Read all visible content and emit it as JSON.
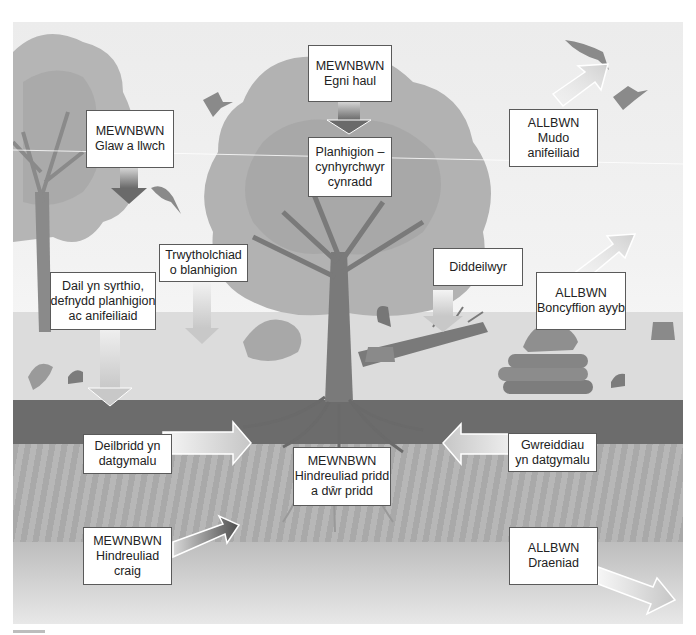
{
  "diagram": {
    "colors": {
      "sky": "#efefef",
      "ground": "#dcdcdc",
      "topsoil": "#6c6c6c",
      "subsoil": "#b0b0b0",
      "box_border": "#5a5a5a",
      "box_fill": "#ffffff"
    },
    "labels": {
      "glaw": {
        "line1": "MEWNBWN",
        "line2": "Glaw a llwch"
      },
      "egni": {
        "line1": "MEWNBWN",
        "line2": "Egni haul"
      },
      "planhigion": {
        "line1": "Planhigion –",
        "line2": "cynhyrchwyr",
        "line3": "cynradd"
      },
      "mudo": {
        "line1": "ALLBWN",
        "line2": "Mudo",
        "line3": "anifeiliaid"
      },
      "trwytholchiad": {
        "line1": "Trwytholchiad",
        "line2": "o blanhigion"
      },
      "dail": {
        "line1": "Dail yn syrthio,",
        "line2": "defnydd planhigion",
        "line3": "ac anifeiliaid"
      },
      "diddeilwyr": {
        "line1": "Diddeilwyr"
      },
      "boncyffion": {
        "line1": "ALLBWN",
        "line2": "Boncyffion ayyb"
      },
      "deilbridd": {
        "line1": "Deilbridd yn",
        "line2": "datgymalu"
      },
      "hindreuliad_pridd": {
        "line1": "MEWNBWN",
        "line2": "Hindreuliad pridd",
        "line3": "a dŵr pridd"
      },
      "gwreiddiau": {
        "line1": "Gwreiddiau",
        "line2": "yn datgymalu"
      },
      "hindreuliad_craig": {
        "line1": "MEWNBWN",
        "line2": "Hindreuliad",
        "line3": "craig"
      },
      "draeniad": {
        "line1": "ALLBWN",
        "line2": "Draeniad"
      }
    },
    "icons": [
      "bird-icon",
      "squirrel-icon",
      "rabbit-icon",
      "hedgehog-icon",
      "log-pile-icon",
      "fallen-tree-icon",
      "tree-stump-icon",
      "bush-icon",
      "fern-icon",
      "tree-icon"
    ]
  }
}
